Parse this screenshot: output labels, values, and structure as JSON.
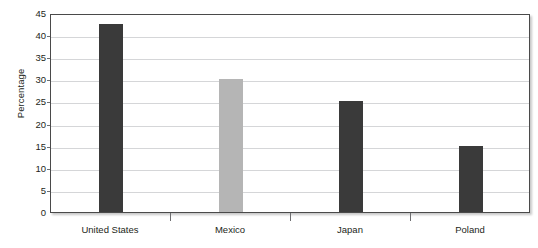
{
  "chart_data": {
    "type": "bar",
    "title": "",
    "subtitle": "",
    "xlabel": "",
    "ylabel": "Percentage",
    "categories": [
      "United States",
      "Mexico",
      "Japan",
      "Poland"
    ],
    "values": [
      42.5,
      30,
      25,
      15
    ],
    "series": [
      {
        "name": "Percentage",
        "values": [
          42.5,
          30,
          25,
          15
        ]
      }
    ],
    "bar_colors": [
      "#3a3a3a",
      "#b5b5b5",
      "#3a3a3a",
      "#3a3a3a"
    ],
    "ylim": [
      0,
      45
    ],
    "y_ticks": [
      0,
      5,
      10,
      15,
      20,
      25,
      30,
      35,
      40,
      45
    ],
    "y_tick_labels": [
      "0",
      "5",
      "10",
      "15",
      "20",
      "25",
      "30",
      "35",
      "40",
      "45"
    ],
    "grid": true,
    "grid_axis": "y",
    "legend": false,
    "legend_position": "none",
    "annotations": [],
    "frame": true,
    "plot_background": "#ffffff",
    "axis_color": "#4a4a4a",
    "grid_color": "#d5d6d8",
    "text_color": "#231f20"
  }
}
